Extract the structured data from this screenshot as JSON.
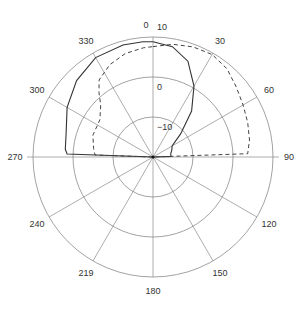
{
  "chart_data": {
    "type": "polar-line",
    "title": "",
    "angle_unit": "degrees",
    "angle_direction": "clockwise",
    "zero_location": "top",
    "angle_tick_labels": [
      {
        "angle": 0,
        "label": "0"
      },
      {
        "angle": 30,
        "label": "30"
      },
      {
        "angle": 60,
        "label": "60"
      },
      {
        "angle": 90,
        "label": "90"
      },
      {
        "angle": 120,
        "label": "120"
      },
      {
        "angle": 150,
        "label": "150"
      },
      {
        "angle": 180,
        "label": "180"
      },
      {
        "angle": 210,
        "label": "219"
      },
      {
        "angle": 240,
        "label": "240"
      },
      {
        "angle": 270,
        "label": "270"
      },
      {
        "angle": 300,
        "label": "300"
      },
      {
        "angle": 330,
        "label": "330"
      }
    ],
    "radial_tick_labels": [
      {
        "value": 10,
        "label": "10"
      },
      {
        "value": 0,
        "label": "0"
      },
      {
        "value": -10,
        "label": "-10"
      }
    ],
    "rlim": [
      -20,
      10
    ],
    "grid": true,
    "legend": null,
    "series": [
      {
        "name": "solid",
        "style": "solid",
        "points": [
          [
            0,
            8.8
          ],
          [
            10,
            8.0
          ],
          [
            20,
            5.5
          ],
          [
            30,
            0.5
          ],
          [
            40,
            -5.0
          ],
          [
            50,
            -11.0
          ],
          [
            60,
            -14.5
          ],
          [
            70,
            -15.0
          ],
          [
            80,
            -15.5
          ],
          [
            88,
            -15.5
          ],
          [
            90,
            -20
          ],
          [
            270,
            -20
          ],
          [
            272,
            1.5
          ],
          [
            275,
            2.0
          ],
          [
            285,
            2.5
          ],
          [
            300,
            4.8
          ],
          [
            315,
            7.0
          ],
          [
            330,
            8.7
          ],
          [
            345,
            9.0
          ],
          [
            355,
            8.9
          ],
          [
            360,
            8.8
          ]
        ]
      },
      {
        "name": "dashed",
        "style": "dashed",
        "points": [
          [
            0,
            7.6
          ],
          [
            10,
            8.6
          ],
          [
            20,
            9.3
          ],
          [
            30,
            9.6
          ],
          [
            40,
            8.8
          ],
          [
            50,
            7.2
          ],
          [
            60,
            6.0
          ],
          [
            70,
            5.2
          ],
          [
            80,
            4.5
          ],
          [
            88,
            3.7
          ],
          [
            90,
            -20
          ],
          [
            270,
            -20
          ],
          [
            272,
            -5.5
          ],
          [
            278,
            -5.0
          ],
          [
            290,
            -4.0
          ],
          [
            305,
            -3.8
          ],
          [
            315,
            -1.5
          ],
          [
            320,
            1.0
          ],
          [
            325,
            3.5
          ],
          [
            335,
            5.5
          ],
          [
            345,
            6.8
          ],
          [
            355,
            7.4
          ],
          [
            360,
            7.6
          ]
        ]
      }
    ]
  },
  "layout": {
    "cx": 153,
    "cy": 157,
    "r_outer": 120,
    "px_per_10db": 40
  }
}
